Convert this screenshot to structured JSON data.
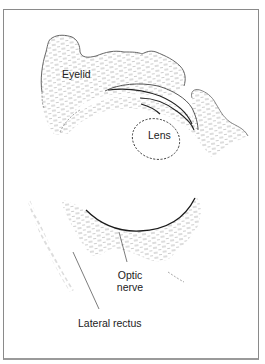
{
  "figure": {
    "type": "anatomical line drawing",
    "labels": {
      "eyelid": "Eyelid",
      "lens": "Lens",
      "optic_nerve_line1": "Optic",
      "optic_nerve_line2": "nerve",
      "lateral_rectus": "Lateral rectus"
    },
    "colors": {
      "line": "#333333",
      "hatch": "#9a9a9a",
      "frame": "#8a8a8a",
      "background": "#ffffff"
    }
  }
}
